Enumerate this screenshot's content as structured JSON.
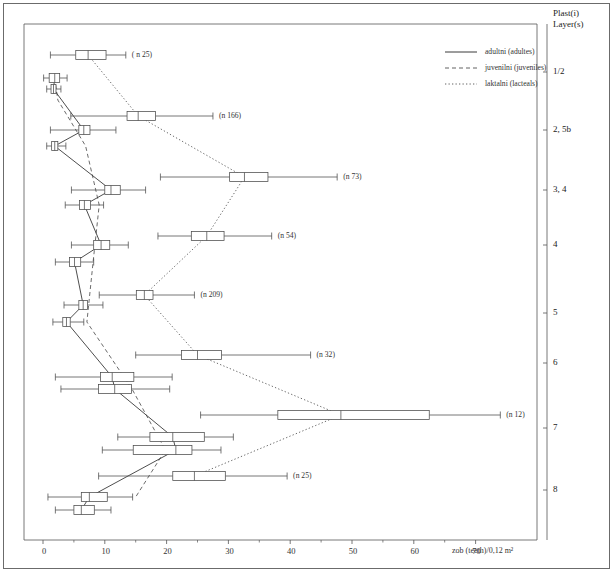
{
  "figure": {
    "outer_frame": true,
    "corner_title_line1": "Plast(i)",
    "corner_title_line2": "Layer(s)"
  },
  "legend": {
    "position": "top-right-inside",
    "entries": [
      {
        "label": "adultni (adultes)",
        "style": "solid",
        "key": "adults"
      },
      {
        "label": "juvenilni (juveniles)",
        "style": "dashed",
        "key": "juveniles"
      },
      {
        "label": "laktalni (lacteals)",
        "style": "dotted",
        "key": "lacteals"
      }
    ]
  },
  "chart_data": {
    "type": "box",
    "orientation": "horizontal",
    "title": "",
    "xlabel": "zob (teeth)/0,12 m²",
    "ylabel": "Plast(i) / Layer(s)",
    "xlim": [
      -3,
      76
    ],
    "xticks": [
      0,
      10,
      20,
      30,
      40,
      50,
      60,
      70
    ],
    "xtick_labels": [
      "0",
      "10",
      "20",
      "30",
      "40",
      "50",
      "60",
      "70"
    ],
    "xminorticks": [
      5,
      15,
      25,
      35,
      45,
      55,
      65
    ],
    "grid": false,
    "ylim_layers": [
      "1/2",
      "2, 5b",
      "3, 4",
      "4",
      "5",
      "6",
      "7",
      "8"
    ],
    "ytick_labels": [
      "1/2",
      "2, 5b",
      "3, 4",
      "4",
      "5",
      "6",
      "7",
      "8"
    ],
    "ytick_y_px": [
      72,
      130,
      190,
      245,
      313,
      363,
      428,
      490
    ],
    "series": [
      {
        "name": "adultni (adultes)",
        "key": "adults",
        "line_style": "solid",
        "boxes": [
          {
            "layer": "1/2",
            "y": 78,
            "low": 0.1,
            "q1": 1.0,
            "med": 1.9,
            "q3": 2.7,
            "high": 3.9,
            "n_label": ""
          },
          {
            "layer": "1/2b",
            "y": 89,
            "low": 0.6,
            "q1": 1.3,
            "med": 1.7,
            "q3": 2.1,
            "high": 2.9,
            "n_label": ""
          },
          {
            "layer": "2,5b",
            "y": 130,
            "low": 1.2,
            "q1": 5.8,
            "med": 6.6,
            "q3": 7.6,
            "high": 11.8,
            "n_label": ""
          },
          {
            "layer": "2,5bb",
            "y": 146,
            "low": 0.6,
            "q1": 1.4,
            "med": 1.9,
            "q3": 2.4,
            "high": 3.7,
            "n_label": ""
          },
          {
            "layer": "3,4",
            "y": 190,
            "low": 4.6,
            "q1": 10.0,
            "med": 11.0,
            "q3": 12.5,
            "high": 16.6,
            "n_label": ""
          },
          {
            "layer": "3,4b",
            "y": 205,
            "low": 3.6,
            "q1": 5.9,
            "med": 6.7,
            "q3": 7.7,
            "high": 9.8,
            "n_label": ""
          },
          {
            "layer": "4",
            "y": 245,
            "low": 4.6,
            "q1": 8.2,
            "med": 9.4,
            "q3": 10.8,
            "high": 13.8,
            "n_label": ""
          },
          {
            "layer": "4b",
            "y": 262,
            "low": 2.0,
            "q1": 4.3,
            "med": 5.1,
            "q3": 6.1,
            "high": 8.2,
            "n_label": ""
          },
          {
            "layer": "5",
            "y": 305,
            "low": 3.4,
            "q1": 5.8,
            "med": 6.5,
            "q3": 7.2,
            "high": 9.7,
            "n_label": ""
          },
          {
            "layer": "5b",
            "y": 322,
            "low": 1.6,
            "q1": 3.2,
            "med": 3.8,
            "q3": 4.4,
            "high": 6.6,
            "n_label": ""
          },
          {
            "layer": "6",
            "y": 377,
            "low": 2.0,
            "q1": 9.3,
            "med": 11.2,
            "q3": 14.7,
            "high": 20.9,
            "n_label": ""
          },
          {
            "layer": "6b",
            "y": 389,
            "low": 2.9,
            "q1": 9.0,
            "med": 11.6,
            "q3": 14.3,
            "high": 20.5,
            "n_label": ""
          },
          {
            "layer": "7",
            "y": 437,
            "low": 12.1,
            "q1": 17.3,
            "med": 21.0,
            "q3": 26.1,
            "high": 30.8,
            "n_label": ""
          },
          {
            "layer": "7b",
            "y": 450,
            "low": 9.6,
            "q1": 14.6,
            "med": 21.5,
            "q3": 24.1,
            "high": 28.8,
            "n_label": ""
          },
          {
            "layer": "8",
            "y": 497,
            "low": 0.8,
            "q1": 6.2,
            "med": 7.5,
            "q3": 10.4,
            "high": 14.5,
            "n_label": ""
          },
          {
            "layer": "8b",
            "y": 510,
            "low": 2.0,
            "q1": 5.0,
            "med": 6.2,
            "q3": 8.3,
            "high": 11.0,
            "n_label": ""
          }
        ],
        "connector_points": [
          [
            1.9,
            78
          ],
          [
            1.7,
            89
          ],
          [
            6.6,
            130
          ],
          [
            1.9,
            146
          ],
          [
            11.0,
            190
          ],
          [
            6.7,
            205
          ],
          [
            9.4,
            245
          ],
          [
            5.1,
            262
          ],
          [
            6.5,
            305
          ],
          [
            3.8,
            322
          ],
          [
            11.2,
            377
          ],
          [
            11.6,
            389
          ],
          [
            21.0,
            437
          ],
          [
            21.5,
            450
          ],
          [
            7.5,
            497
          ],
          [
            6.2,
            510
          ]
        ]
      },
      {
        "name": "juvenilni (juveniles)",
        "key": "juveniles",
        "line_style": "dashed",
        "boxes": [],
        "connector_points": [
          [
            1.9,
            78
          ],
          [
            2.4,
            100
          ],
          [
            6.9,
            146
          ],
          [
            9.1,
            205
          ],
          [
            8.1,
            262
          ],
          [
            7.1,
            322
          ],
          [
            14.4,
            389
          ],
          [
            19.8,
            450
          ],
          [
            15.0,
            497
          ]
        ]
      },
      {
        "name": "laktalni (lacteals)",
        "key": "lacteals",
        "line_style": "dotted",
        "boxes": [
          {
            "layer": "1/2",
            "y": 55,
            "low": 1.2,
            "q1": 5.3,
            "med": 7.3,
            "q3": 10.2,
            "high": 13.4,
            "n_label": "( n 25)"
          },
          {
            "layer": "2,5b",
            "y": 116,
            "low": 4.5,
            "q1": 13.6,
            "med": 15.4,
            "q3": 18.2,
            "high": 27.5,
            "n_label": "(n 166)"
          },
          {
            "layer": "3,4",
            "y": 177,
            "low": 19.0,
            "q1": 30.2,
            "med": 32.6,
            "q3": 36.4,
            "high": 47.6,
            "n_label": "(n 73)"
          },
          {
            "layer": "4",
            "y": 236,
            "low": 18.6,
            "q1": 24.0,
            "med": 26.5,
            "q3": 29.3,
            "high": 37.0,
            "n_label": "(n 54)"
          },
          {
            "layer": "5",
            "y": 295,
            "low": 9.1,
            "q1": 15.1,
            "med": 16.4,
            "q3": 17.8,
            "high": 24.5,
            "n_label": "(n 209)"
          },
          {
            "layer": "6",
            "y": 355,
            "low": 15.0,
            "q1": 22.4,
            "med": 25.0,
            "q3": 28.9,
            "high": 43.3,
            "n_label": "(n 32)"
          },
          {
            "layer": "7",
            "y": 415,
            "low": 25.5,
            "q1": 38.0,
            "med": 48.2,
            "q3": 62.5,
            "high": 74.0,
            "n_label": "(n 12)"
          },
          {
            "layer": "8",
            "y": 476,
            "low": 9.0,
            "q1": 21.0,
            "med": 24.5,
            "q3": 29.5,
            "high": 39.5,
            "n_label": "(n 25)"
          }
        ],
        "connector_points": [
          [
            7.3,
            55
          ],
          [
            15.4,
            116
          ],
          [
            32.6,
            177
          ],
          [
            26.5,
            236
          ],
          [
            16.4,
            295
          ],
          [
            25.0,
            355
          ],
          [
            48.2,
            415
          ],
          [
            24.5,
            476
          ]
        ]
      }
    ]
  }
}
